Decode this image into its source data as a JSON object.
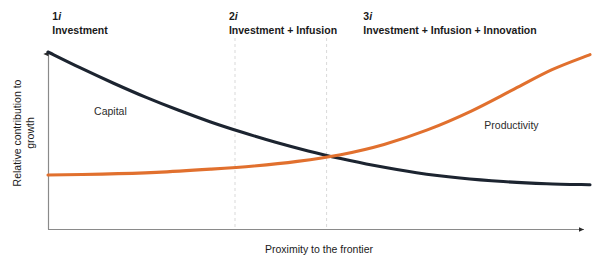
{
  "chart_data": {
    "type": "line",
    "title": "",
    "xlabel": "Proximity to the frontier",
    "ylabel": "Relative contribution to growth",
    "grid": "vertical-dashed-phase-dividers",
    "legend_position": "inline-series-labels",
    "xlim": [
      0,
      1
    ],
    "ylim": [
      0,
      1
    ],
    "axis_ticks": "none",
    "phase_dividers_x": [
      0.345,
      0.514
    ],
    "crossover_point": {
      "x": 0.515,
      "y": 0.365
    },
    "series": [
      {
        "name": "Capital",
        "color": "#1c2430",
        "label_x": 0.085,
        "label_y": 0.66,
        "description": "Decaying curve: high at low proximity, flattening near zero at the frontier",
        "x": [
          0.0,
          0.06,
          0.12,
          0.18,
          0.24,
          0.3,
          0.36,
          0.42,
          0.48,
          0.54,
          0.6,
          0.68,
          0.76,
          0.84,
          0.92,
          1.0
        ],
        "y": [
          1.0,
          0.91,
          0.825,
          0.745,
          0.672,
          0.605,
          0.545,
          0.49,
          0.441,
          0.398,
          0.36,
          0.318,
          0.288,
          0.268,
          0.256,
          0.25
        ]
      },
      {
        "name": "Productivity",
        "color": "#e1702e",
        "label_x": 0.805,
        "label_y": 0.585,
        "description": "Near-flat at low proximity then accelerating sharply upward toward the frontier",
        "x": [
          0.0,
          0.1,
          0.2,
          0.3,
          0.38,
          0.46,
          0.54,
          0.62,
          0.7,
          0.78,
          0.86,
          0.93,
          1.0
        ],
        "y": [
          0.305,
          0.31,
          0.32,
          0.338,
          0.356,
          0.382,
          0.42,
          0.478,
          0.56,
          0.665,
          0.79,
          0.9,
          0.985
        ]
      }
    ]
  },
  "phases": [
    {
      "code_num": "1",
      "code_ital": "i",
      "name": "Investment",
      "center_x": 80
    },
    {
      "code_num": "2",
      "code_ital": "i",
      "name": "Investment + Infusion",
      "center_x": 283
    },
    {
      "code_num": "3",
      "code_ital": "i",
      "name": "Investment + Infusion + Innovation",
      "center_x": 450
    }
  ],
  "axes": {
    "y_title": "Relative contribution to growth",
    "x_title": "Proximity to the frontier"
  },
  "series_labels": {
    "capital": "Capital",
    "productivity": "Productivity"
  },
  "colors": {
    "capital_line": "#1c2430",
    "productivity_line": "#e1702e",
    "axis": "#7d7d7d",
    "divider": "#d8d8d8",
    "text": "#1a1a1a"
  }
}
